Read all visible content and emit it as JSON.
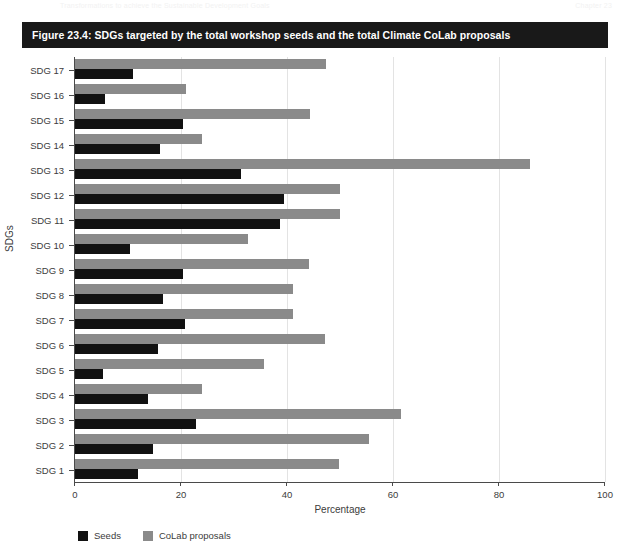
{
  "running_header": {
    "left": "Transformations to achieve the Sustainable Development Goals",
    "right": "Chapter 23"
  },
  "caption": {
    "text": "Figure 23.4: SDGs targeted by the total workshop seeds and the total Climate CoLab proposals"
  },
  "colors": {
    "seeds": "#111111",
    "colab": "#8a8a8a",
    "caption_bar": "#191919",
    "grid": "#e3e3e3",
    "axis": "#4a4a4a"
  },
  "chart_data": {
    "type": "bar",
    "orientation": "horizontal",
    "title": "Figure 23.4: SDGs targeted by the total workshop seeds and the total Climate CoLab proposals",
    "xlabel": "Percentage",
    "ylabel": "SDGs",
    "xlim": [
      0,
      100
    ],
    "xticks": [
      0,
      20,
      40,
      60,
      80,
      100
    ],
    "xticklabels": [
      "0",
      "20",
      "40",
      "60",
      "80",
      "100"
    ],
    "grid": true,
    "grid_axis": "x",
    "legend_position": "bottom-left",
    "categories": [
      "SDG 1",
      "SDG 2",
      "SDG 3",
      "SDG 4",
      "SDG 5",
      "SDG 6",
      "SDG 7",
      "SDG 8",
      "SDG 9",
      "SDG 10",
      "SDG 11",
      "SDG 12",
      "SDG 13",
      "SDG 14",
      "SDG 15",
      "SDG 16",
      "SDG 17"
    ],
    "series": [
      {
        "name": "Seeds",
        "color": "#111111",
        "values": [
          11.9,
          14.7,
          22.8,
          13.8,
          5.3,
          15.7,
          20.7,
          16.6,
          20.3,
          10.4,
          38.7,
          39.4,
          31.3,
          16.0,
          20.4,
          5.7,
          11.0
        ]
      },
      {
        "name": "CoLab proposals",
        "color": "#8a8a8a",
        "values": [
          49.8,
          55.5,
          61.5,
          24.0,
          35.7,
          47.2,
          41.1,
          41.1,
          44.2,
          32.6,
          50.0,
          50.0,
          85.8,
          24.0,
          44.3,
          21.0,
          47.4
        ]
      }
    ]
  },
  "legend": {
    "items": [
      {
        "label": "Seeds",
        "color": "#111111"
      },
      {
        "label": "CoLab proposals",
        "color": "#8a8a8a"
      }
    ]
  }
}
